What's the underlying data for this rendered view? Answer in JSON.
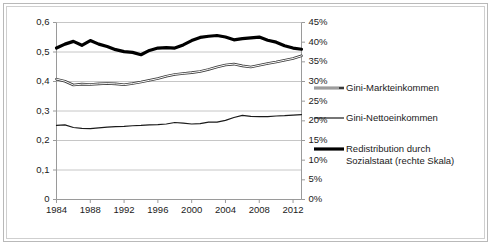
{
  "chart_data": {
    "type": "line",
    "title": "",
    "xlabel": "",
    "ylabel": "",
    "grid": true,
    "legend_position": "right",
    "x": [
      1984,
      1985,
      1986,
      1987,
      1988,
      1989,
      1990,
      1991,
      1992,
      1993,
      1994,
      1995,
      1996,
      1997,
      1998,
      1999,
      2000,
      2001,
      2002,
      2003,
      2004,
      2005,
      2006,
      2007,
      2008,
      2009,
      2010,
      2011,
      2012,
      2013
    ],
    "x_tick_labels": [
      "1984",
      "1988",
      "1992",
      "1996",
      "2000",
      "2004",
      "2008",
      "2012"
    ],
    "x_ticks": [
      1984,
      1988,
      1992,
      1996,
      2000,
      2004,
      2008,
      2012
    ],
    "xlim": [
      1984,
      2013
    ],
    "left_axis": {
      "label": "",
      "ylim": [
        0,
        0.6
      ],
      "tick_labels": [
        "0",
        "0,1",
        "0,2",
        "0,3",
        "0,4",
        "0,5",
        "0,6"
      ],
      "tick_values": [
        0,
        0.1,
        0.2,
        0.3,
        0.4,
        0.5,
        0.6
      ]
    },
    "right_axis": {
      "label": "",
      "ylim": [
        0,
        0.45
      ],
      "tick_labels": [
        "0%",
        "5%",
        "10%",
        "15%",
        "20%",
        "25%",
        "30%",
        "35%",
        "40%",
        "45%"
      ],
      "tick_values": [
        0,
        0.05,
        0.1,
        0.15,
        0.2,
        0.25,
        0.3,
        0.35,
        0.4,
        0.45
      ]
    },
    "series": [
      {
        "name": "Gini-Markteinkommen",
        "axis": "left",
        "style": "double-stroke",
        "color": "#3a3a3a",
        "values": [
          0.408,
          0.401,
          0.388,
          0.391,
          0.39,
          0.392,
          0.393,
          0.392,
          0.389,
          0.393,
          0.398,
          0.404,
          0.41,
          0.418,
          0.424,
          0.427,
          0.43,
          0.434,
          0.441,
          0.449,
          0.456,
          0.459,
          0.453,
          0.449,
          0.455,
          0.461,
          0.466,
          0.472,
          0.478,
          0.487
        ]
      },
      {
        "name": "Gini-Nettoeinkommen",
        "axis": "left",
        "style": "thin",
        "color": "#1a1a1a",
        "values": [
          0.251,
          0.253,
          0.244,
          0.241,
          0.24,
          0.243,
          0.245,
          0.247,
          0.248,
          0.25,
          0.251,
          0.253,
          0.254,
          0.256,
          0.261,
          0.259,
          0.256,
          0.257,
          0.262,
          0.262,
          0.268,
          0.278,
          0.285,
          0.282,
          0.281,
          0.281,
          0.283,
          0.284,
          0.286,
          0.288
        ]
      },
      {
        "name": "Redistribution durch Sozialstaat (rechte Skala)",
        "axis": "right",
        "style": "thick",
        "color": "#000000",
        "values": [
          0.385,
          0.395,
          0.402,
          0.392,
          0.404,
          0.395,
          0.389,
          0.381,
          0.376,
          0.374,
          0.368,
          0.379,
          0.385,
          0.386,
          0.385,
          0.393,
          0.404,
          0.412,
          0.415,
          0.417,
          0.413,
          0.406,
          0.409,
          0.411,
          0.413,
          0.405,
          0.4,
          0.391,
          0.385,
          0.382
        ]
      }
    ]
  },
  "legend": {
    "items": [
      {
        "label": "Gini-Markteinkommen",
        "swatch": "double-stroke"
      },
      {
        "label": "Gini-Nettoeinkommen",
        "swatch": "thin"
      },
      {
        "label_line1": "Redistribution durch",
        "label_line2": "Sozialstaat (rechte Skala)",
        "swatch": "thick"
      }
    ]
  }
}
